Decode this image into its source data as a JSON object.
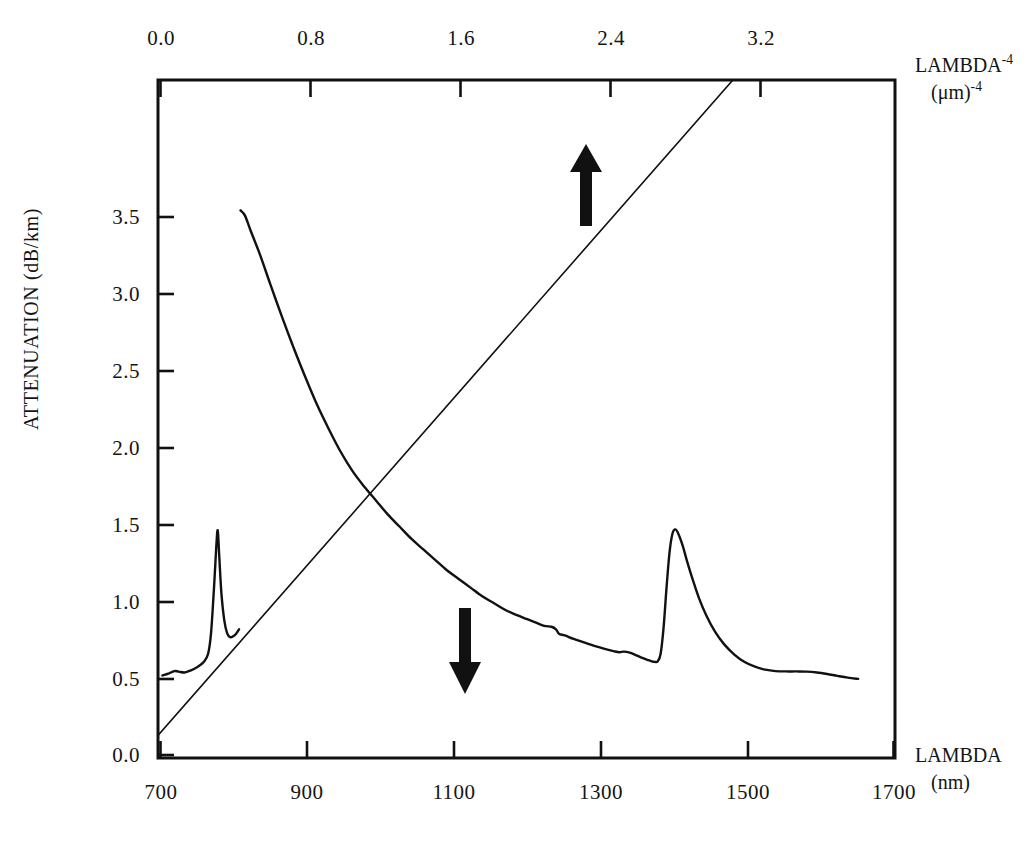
{
  "chart_data": {
    "type": "line",
    "title": "",
    "subtitle": "",
    "axes": {
      "bottom": {
        "label_line1": "LAMBDA",
        "label_line2": "(nm)",
        "ticks": [
          700,
          900,
          1100,
          1300,
          1500,
          1700
        ],
        "tick_labels": [
          "700",
          "900",
          "1100",
          "1300",
          "1500",
          "1700"
        ],
        "range": [
          700,
          1700
        ],
        "unit": "nm"
      },
      "top": {
        "label_line1_base": "LAMBDA",
        "label_line1_exp": "-4",
        "label_line2_base": "(μm)",
        "label_line2_exp": "-4",
        "ticks": [
          0.0,
          0.8,
          1.6,
          2.4,
          3.2
        ],
        "tick_labels": [
          "0.0",
          "0.8",
          "1.6",
          "2.4",
          "3.2"
        ],
        "range": [
          0.0,
          4.0
        ],
        "unit": "um^-4"
      },
      "left": {
        "label": "ATTENUATION  (dB/km)",
        "ticks": [
          0.0,
          0.5,
          1.0,
          1.5,
          2.0,
          2.5,
          3.0,
          3.5
        ],
        "tick_labels": [
          "0.0",
          "0.5",
          "1.0",
          "1.5",
          "2.0",
          "2.5",
          "3.0",
          "3.5"
        ],
        "range": [
          0.0,
          3.9
        ],
        "unit": "dB/km"
      },
      "grid": false,
      "legend": "none"
    },
    "annotations": [
      {
        "name": "up-arrow",
        "direction": "up",
        "x_nm": 1270,
        "y_db": 2.55,
        "refers_to": "rayleigh-line"
      },
      {
        "name": "down-arrow",
        "direction": "down",
        "x_nm": 1110,
        "y_db": 0.78,
        "refers_to": "measured-attenuation"
      }
    ],
    "series": [
      {
        "name": "measured-attenuation",
        "axis": "bottom",
        "stroke": "#111111",
        "width": 2.4,
        "points_nm_db": [
          [
            812,
            3.15
          ],
          [
            818,
            3.12
          ],
          [
            826,
            3.03
          ],
          [
            838,
            2.9
          ],
          [
            852,
            2.73
          ],
          [
            868,
            2.54
          ],
          [
            884,
            2.36
          ],
          [
            900,
            2.19
          ],
          [
            916,
            2.03
          ],
          [
            932,
            1.89
          ],
          [
            948,
            1.76
          ],
          [
            964,
            1.65
          ],
          [
            980,
            1.56
          ],
          [
            996,
            1.48
          ],
          [
            1012,
            1.4
          ],
          [
            1028,
            1.33
          ],
          [
            1044,
            1.26
          ],
          [
            1060,
            1.2
          ],
          [
            1076,
            1.14
          ],
          [
            1092,
            1.08
          ],
          [
            1108,
            1.03
          ],
          [
            1124,
            0.98
          ],
          [
            1140,
            0.93
          ],
          [
            1156,
            0.89
          ],
          [
            1172,
            0.85
          ],
          [
            1188,
            0.82
          ],
          [
            1200,
            0.8
          ],
          [
            1212,
            0.78
          ],
          [
            1224,
            0.76
          ],
          [
            1234,
            0.755
          ],
          [
            1240,
            0.74
          ],
          [
            1244,
            0.715
          ],
          [
            1252,
            0.705
          ],
          [
            1264,
            0.685
          ],
          [
            1278,
            0.665
          ],
          [
            1292,
            0.645
          ],
          [
            1306,
            0.628
          ],
          [
            1318,
            0.615
          ],
          [
            1326,
            0.608
          ],
          [
            1332,
            0.612
          ],
          [
            1340,
            0.606
          ],
          [
            1348,
            0.592
          ],
          [
            1356,
            0.578
          ],
          [
            1364,
            0.565
          ],
          [
            1370,
            0.556
          ],
          [
            1374,
            0.553
          ],
          [
            1378,
            0.556
          ],
          [
            1382,
            0.6
          ],
          [
            1386,
            0.75
          ],
          [
            1390,
            0.98
          ],
          [
            1394,
            1.18
          ],
          [
            1398,
            1.29
          ],
          [
            1402,
            1.315
          ],
          [
            1406,
            1.29
          ],
          [
            1412,
            1.22
          ],
          [
            1418,
            1.13
          ],
          [
            1426,
            1.02
          ],
          [
            1434,
            0.92
          ],
          [
            1444,
            0.82
          ],
          [
            1456,
            0.725
          ],
          [
            1468,
            0.655
          ],
          [
            1482,
            0.595
          ],
          [
            1496,
            0.552
          ],
          [
            1510,
            0.525
          ],
          [
            1524,
            0.508
          ],
          [
            1538,
            0.5
          ],
          [
            1552,
            0.498
          ],
          [
            1566,
            0.498
          ],
          [
            1580,
            0.497
          ],
          [
            1594,
            0.492
          ],
          [
            1608,
            0.483
          ],
          [
            1622,
            0.472
          ],
          [
            1636,
            0.462
          ],
          [
            1650,
            0.455
          ]
        ],
        "oh_peaks": [
          {
            "center_nm": 780,
            "peak_db": 1.31,
            "baseline_db": 0.5,
            "width_nm": 11
          },
          {
            "center_nm": 1400,
            "peak_db": 1.32,
            "baseline_db": 0.55,
            "width_nm": 30
          }
        ],
        "short_segment_nm_db": [
          [
            706,
            0.475
          ],
          [
            714,
            0.485
          ],
          [
            722,
            0.5
          ],
          [
            728,
            0.497
          ],
          [
            736,
            0.492
          ],
          [
            744,
            0.503
          ],
          [
            754,
            0.525
          ],
          [
            762,
            0.552
          ],
          [
            768,
            0.6
          ],
          [
            772,
            0.72
          ],
          [
            776,
            0.98
          ],
          [
            779,
            1.21
          ],
          [
            781,
            1.31
          ],
          [
            783,
            1.17
          ],
          [
            786,
            0.95
          ],
          [
            790,
            0.79
          ],
          [
            794,
            0.715
          ],
          [
            798,
            0.695
          ],
          [
            802,
            0.7
          ],
          [
            806,
            0.715
          ],
          [
            810,
            0.74
          ]
        ]
      },
      {
        "name": "rayleigh-line",
        "axis": "top",
        "stroke": "#111111",
        "width": 1.6,
        "description": "Straight line: attenuation proportional to lambda^-4",
        "endpoints_nm_db": [
          [
            700,
            0.13
          ],
          [
            1480,
            3.9
          ]
        ],
        "endpoints_lambda4_db": [
          [
            0.0,
            0.08
          ],
          [
            3.33,
            3.9
          ]
        ],
        "slope_db_per_um4": 1.145,
        "intercept_db": 0.08
      }
    ]
  },
  "plot_geometry": {
    "left_px": 158,
    "right_px": 895,
    "top_px": 80,
    "bottom_px": 758
  }
}
